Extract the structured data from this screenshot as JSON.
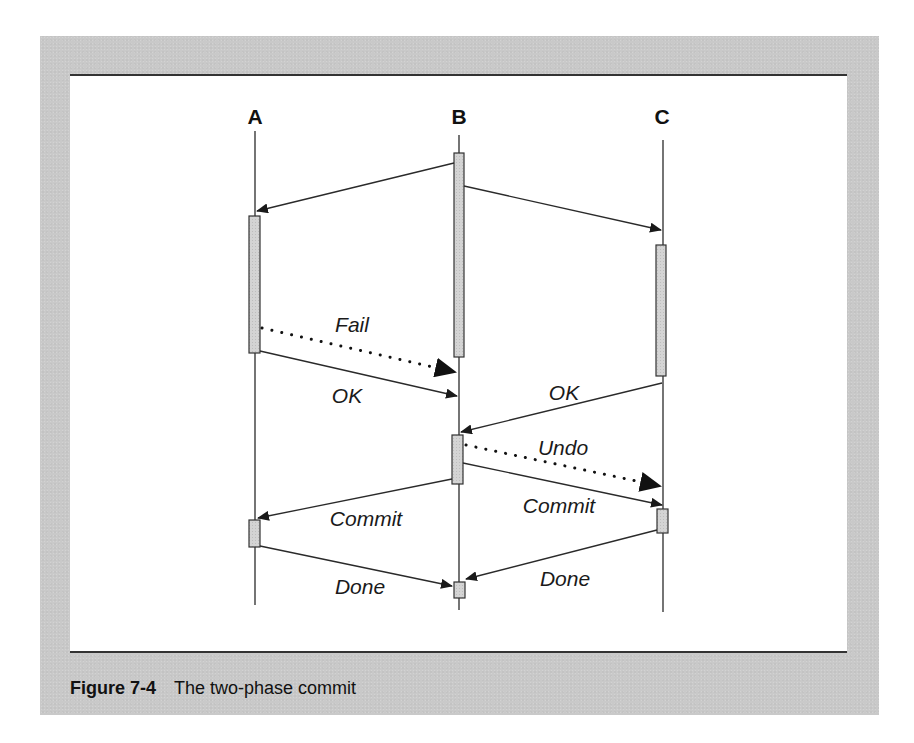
{
  "figure": {
    "number": "Figure 7-4",
    "caption": "The two-phase commit"
  },
  "participants": [
    {
      "id": "A",
      "label": "A"
    },
    {
      "id": "B",
      "label": "B"
    },
    {
      "id": "C",
      "label": "C"
    }
  ],
  "messages": [
    {
      "from": "B",
      "to": "A",
      "label": "",
      "style": "solid"
    },
    {
      "from": "B",
      "to": "C",
      "label": "",
      "style": "solid"
    },
    {
      "from": "A",
      "to": "B",
      "label": "Fail",
      "style": "dotted"
    },
    {
      "from": "A",
      "to": "B",
      "label": "OK",
      "style": "solid"
    },
    {
      "from": "C",
      "to": "B",
      "label": "OK",
      "style": "solid"
    },
    {
      "from": "B",
      "to": "C",
      "label": "Undo",
      "style": "dotted"
    },
    {
      "from": "B",
      "to": "C",
      "label": "Commit",
      "style": "solid"
    },
    {
      "from": "B",
      "to": "A",
      "label": "Commit",
      "style": "solid"
    },
    {
      "from": "A",
      "to": "B",
      "label": "Done",
      "style": "solid"
    },
    {
      "from": "C",
      "to": "B",
      "label": "Done",
      "style": "solid"
    }
  ],
  "colors": {
    "panel": "#c9c9c9",
    "activation": "#d2d2d2",
    "line": "#2a2a2a"
  }
}
